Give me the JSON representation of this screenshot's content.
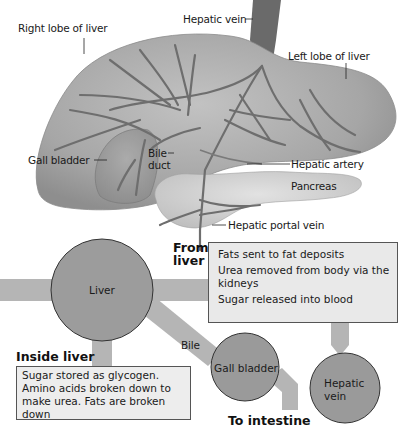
{
  "anatomy": {
    "labels": {
      "right_lobe": "Right lobe of liver",
      "hepatic_vein": "Hepatic vein",
      "left_lobe": "Left lobe of liver",
      "gall_bladder": "Gall bladder",
      "bile_duct_1": "Bile",
      "bile_duct_2": "duct",
      "hepatic_artery": "Hepatic artery",
      "pancreas": "Pancreas",
      "hepatic_portal_vein": "Hepatic portal vein"
    }
  },
  "flow": {
    "nodes": {
      "liver": "Liver",
      "gall_bladder": "Gall bladder",
      "hepatic_vein_1": "Hepatic",
      "hepatic_vein_2": "vein"
    },
    "from_liver": {
      "heading_1": "From",
      "heading_2": "liver",
      "items": [
        "Fats sent to fat deposits",
        "Urea removed from body via the kidneys",
        "Sugar released into blood"
      ]
    },
    "inside_liver": {
      "heading": "Inside liver",
      "text": "Sugar stored as glycogen. Amino acids broken down to make urea. Fats are broken down"
    },
    "bile_label": "Bile",
    "to_intestine": "To intestine"
  },
  "colors": {
    "organ": "#a9a9a9",
    "vessel": "#6e6e6e",
    "node": "#9a9a9a",
    "arrow": "#b5b5b5",
    "box": "#e9e9e9"
  }
}
